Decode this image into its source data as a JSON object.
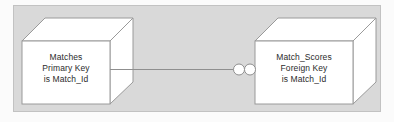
{
  "diagram": {
    "type": "entity-relationship",
    "background_color": "#fbfbfb",
    "frame_fill": "#d9d9d9",
    "frame_border_color": "#c2c2c2",
    "cube_face_color": "#ffffff",
    "cube_line_color": "#9a9a9a",
    "connector_color": "#8f8f8f",
    "text_color": "#2b2b2b",
    "nodes": [
      {
        "id": "matches",
        "name": "matches-entity-cube",
        "lines": [
          "Matches",
          "Primary Key",
          "is Match_Id"
        ],
        "table": "Matches",
        "key_type": "Primary Key",
        "key_field": "Match_Id"
      },
      {
        "id": "match_scores",
        "name": "match-scores-entity-cube",
        "lines": [
          "Match_Scores",
          "Foreign Key",
          "is Match_Id"
        ],
        "table": "Match_Scores",
        "key_type": "Foreign Key",
        "key_field": "Match_Id"
      }
    ],
    "connector": {
      "name": "relationship-connector",
      "from": "matches",
      "to": "match_scores",
      "marker_count": 2,
      "marker_shape": "circle"
    }
  }
}
